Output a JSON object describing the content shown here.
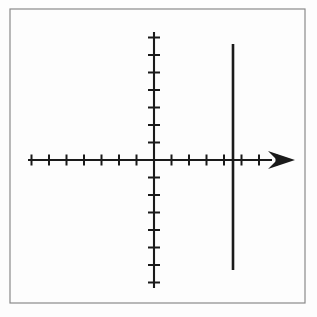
{
  "figure": {
    "background_color": "#fdfdfd",
    "ink_color": "#1a1a1a",
    "frame_color": "#8a8a8a"
  },
  "frame": {
    "name": "image-border",
    "x": 10,
    "y": 9,
    "width": 295,
    "height": 294,
    "stroke_width": 1.2,
    "color": "#8a8a8a"
  },
  "chart_data": {
    "type": "line",
    "subtitle": "",
    "xlabel": "",
    "ylabel": "",
    "grid": false,
    "legend": null,
    "origin_px": {
      "x": 154,
      "y": 160
    },
    "unit_px": 17.5,
    "xlim": [
      -7.2,
      8.1
    ],
    "ylim": [
      -7.3,
      7.3
    ],
    "x_axis": {
      "name": "x-axis",
      "start_px": {
        "x": 28,
        "y": 160
      },
      "end_px": {
        "x": 295,
        "y": 160
      },
      "stroke_width": 2.1,
      "arrow": {
        "present": true,
        "direction": "right",
        "tip_px": {
          "x": 295,
          "y": 160
        },
        "base_px": {
          "x": 268,
          "y": 160
        },
        "half_height_px": 9,
        "filled": true
      },
      "tick_length_px": 11,
      "tick_stroke_width": 2.0,
      "ticks_negative": [
        -7,
        -6,
        -5,
        -4,
        -3,
        -2,
        -1
      ],
      "ticks_positive": [
        1,
        2,
        3,
        4,
        5,
        6,
        7
      ],
      "tick_labels": []
    },
    "y_axis": {
      "name": "y-axis",
      "start_px": {
        "x": 154,
        "y": 32
      },
      "end_px": {
        "x": 154,
        "y": 288
      },
      "stroke_width": 2.1,
      "arrow": {
        "present": false
      },
      "tick_length_px": 12,
      "tick_stroke_width": 2.0,
      "ticks_positive": [
        1,
        2,
        3,
        4,
        5,
        6,
        7
      ],
      "ticks_negative": [
        -1,
        -2,
        -3,
        -4,
        -5,
        -6,
        -7
      ],
      "tick_labels": []
    },
    "series": [
      {
        "name": "vertical-line",
        "equation": "x = 4.5",
        "type": "vertical-line",
        "x": 4.5,
        "y_from": 6.6,
        "y_to": -6.3,
        "stroke_width": 2.6,
        "color": "#1a1a1a",
        "px": {
          "x": 233,
          "y_top": 44,
          "y_bottom": 270
        }
      }
    ],
    "annotations": []
  }
}
